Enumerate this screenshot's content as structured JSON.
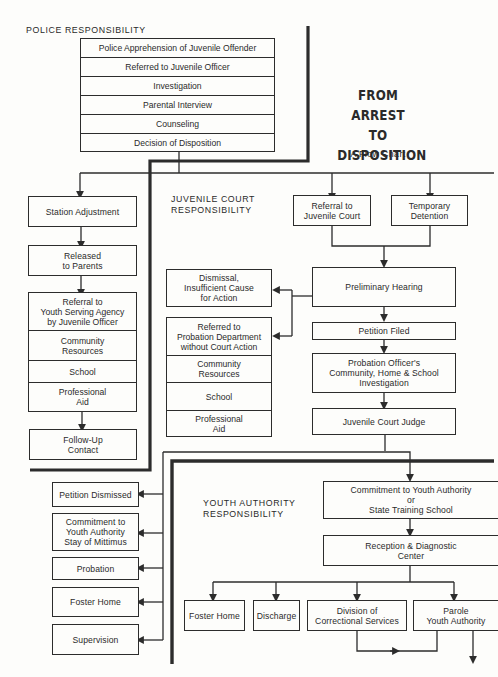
{
  "title": {
    "main": "FROM ARREST\nTO\nDISPOSITION",
    "subtitle": "A Flow Chart"
  },
  "sections": {
    "police": "POLICE RESPONSIBILITY",
    "juvenile_court": "JUVENILE COURT\nRESPONSIBILITY",
    "youth_authority": "YOUTH AUTHORITY\nRESPONSIBILITY"
  },
  "police_steps": [
    "Police Apprehension of Juvenile Offender",
    "Referred to Juvenile Officer",
    "Investigation",
    "Parental Interview",
    "Counseling",
    "Decision of Disposition"
  ],
  "police_branch": {
    "station_adjustment": "Station Adjustment",
    "released": "Released\nto Parents",
    "referral_stack": [
      "Referral to\nYouth Serving Agency\nby Juvenile Officer",
      "Community\nResources",
      "School",
      "Professional\nAid"
    ],
    "follow_up": "Follow-Up\nContact"
  },
  "court_branch": {
    "referral_to_court": "Referral to\nJuvenile Court",
    "temporary_detention": "Temporary\nDetention",
    "preliminary_hearing": "Preliminary Hearing",
    "dismissal": "Dismissal,\nInsufficient Cause\nfor Action",
    "probation_stack": [
      "Referred to\nProbation Department\nwithout Court Action",
      "Community\nResources",
      "School",
      "Professional\nAid"
    ],
    "petition_filed": "Petition Filed",
    "investigation": "Probation Officer's\nCommunity, Home & School\nInvestigation",
    "judge": "Juvenile Court Judge"
  },
  "judge_outcomes": [
    "Petition Dismissed",
    "Commitment to\nYouth Authority\nStay of Mittimus",
    "Probation",
    "Foster Home",
    "Supervision"
  ],
  "youth_authority_branch": {
    "commitment": "Commitment to Youth Authority\nor\nState Training School",
    "reception": "Reception & Diagnostic\nCenter",
    "outcomes": [
      "Foster Home",
      "Discharge",
      "Division of\nCorrectional Services",
      "Parole\nYouth Authority"
    ]
  },
  "colors": {
    "ink": "#2c2c2c",
    "paper": "#fdfdfb"
  }
}
